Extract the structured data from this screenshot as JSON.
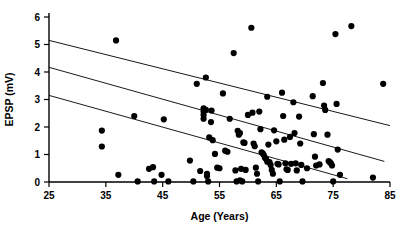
{
  "chart_data": {
    "type": "scatter",
    "title": "",
    "xlabel": "Age (Years)",
    "ylabel": "EPSP (mV)",
    "xlim": [
      25,
      85
    ],
    "ylim": [
      0,
      6
    ],
    "xticks": [
      25,
      35,
      45,
      55,
      65,
      75,
      85
    ],
    "yticks": [
      0,
      1,
      2,
      3,
      4,
      5,
      6
    ],
    "xtick_labels": [
      "25",
      "35",
      "45",
      "55",
      "65",
      "75",
      "85"
    ],
    "ytick_labels": [
      "0",
      "1",
      "2",
      "3",
      "4",
      "5",
      "6"
    ],
    "grid": false,
    "legend": null,
    "marker": "filled-circle",
    "marker_color": "#000000",
    "points": [
      [
        34.3,
        1.87
      ],
      [
        34.3,
        1.29
      ],
      [
        36.8,
        5.15
      ],
      [
        37.2,
        0.26
      ],
      [
        40.0,
        2.4
      ],
      [
        40.6,
        0.02
      ],
      [
        42.6,
        0.48
      ],
      [
        43.3,
        0.54
      ],
      [
        43.5,
        0.02
      ],
      [
        44.8,
        0.26
      ],
      [
        45.2,
        2.28
      ],
      [
        46.0,
        0.02
      ],
      [
        49.8,
        0.78
      ],
      [
        50.4,
        0.02
      ],
      [
        51.0,
        3.57
      ],
      [
        51.6,
        0.4
      ],
      [
        52.2,
        2.68
      ],
      [
        52.2,
        2.56
      ],
      [
        52.2,
        2.44
      ],
      [
        52.2,
        2.3
      ],
      [
        52.6,
        3.8
      ],
      [
        52.6,
        2.62
      ],
      [
        52.8,
        0.3
      ],
      [
        52.8,
        0.22
      ],
      [
        53.0,
        0.02
      ],
      [
        53.2,
        1.62
      ],
      [
        53.5,
        2.18
      ],
      [
        53.6,
        2.6
      ],
      [
        53.8,
        1.52
      ],
      [
        54.2,
        1.02
      ],
      [
        54.6,
        0.52
      ],
      [
        55.0,
        0.5
      ],
      [
        55.6,
        3.22
      ],
      [
        56.0,
        1.14
      ],
      [
        56.4,
        1.1
      ],
      [
        56.8,
        2.3
      ],
      [
        57.5,
        4.69
      ],
      [
        57.8,
        0.42
      ],
      [
        58.0,
        0.02
      ],
      [
        58.2,
        1.86
      ],
      [
        58.4,
        1.72
      ],
      [
        58.6,
        1.78
      ],
      [
        58.6,
        0.06
      ],
      [
        58.8,
        0.48
      ],
      [
        59.0,
        0.02
      ],
      [
        59.2,
        1.44
      ],
      [
        59.4,
        1.42
      ],
      [
        59.6,
        0.44
      ],
      [
        60.0,
        2.44
      ],
      [
        60.6,
        5.61
      ],
      [
        60.8,
        2.52
      ],
      [
        61.0,
        1.4
      ],
      [
        61.2,
        1.3
      ],
      [
        61.4,
        0.52
      ],
      [
        61.6,
        0.3
      ],
      [
        61.8,
        0.02
      ],
      [
        62.0,
        2.56
      ],
      [
        62.2,
        1.92
      ],
      [
        62.4,
        1.08
      ],
      [
        62.6,
        1.04
      ],
      [
        62.8,
        0.98
      ],
      [
        63.0,
        0.88
      ],
      [
        63.2,
        0.84
      ],
      [
        63.4,
        0.74
      ],
      [
        63.4,
        3.1
      ],
      [
        63.6,
        1.36
      ],
      [
        63.8,
        0.72
      ],
      [
        64.0,
        0.62
      ],
      [
        64.2,
        0.44
      ],
      [
        64.4,
        0.3
      ],
      [
        64.6,
        1.88
      ],
      [
        65.0,
        1.48
      ],
      [
        65.2,
        0.66
      ],
      [
        65.4,
        0.64
      ],
      [
        65.6,
        0.02
      ],
      [
        66.0,
        3.25
      ],
      [
        66.2,
        2.4
      ],
      [
        66.4,
        1.54
      ],
      [
        66.6,
        0.68
      ],
      [
        66.8,
        0.46
      ],
      [
        67.0,
        0.44
      ],
      [
        67.4,
        1.64
      ],
      [
        67.6,
        0.66
      ],
      [
        68.0,
        2.9
      ],
      [
        68.2,
        1.78
      ],
      [
        68.4,
        0.68
      ],
      [
        68.6,
        0.42
      ],
      [
        69.0,
        2.38
      ],
      [
        69.2,
        1.4
      ],
      [
        69.4,
        0.62
      ],
      [
        69.6,
        0.02
      ],
      [
        70.4,
        0.5
      ],
      [
        71.4,
        3.12
      ],
      [
        71.6,
        1.74
      ],
      [
        71.8,
        0.92
      ],
      [
        72.0,
        0.6
      ],
      [
        72.6,
        0.64
      ],
      [
        73.2,
        3.6
      ],
      [
        73.4,
        2.78
      ],
      [
        73.6,
        2.62
      ],
      [
        74.0,
        1.72
      ],
      [
        74.2,
        0.76
      ],
      [
        74.4,
        0.72
      ],
      [
        74.6,
        0.68
      ],
      [
        74.8,
        0.6
      ],
      [
        75.0,
        0.02
      ],
      [
        75.4,
        5.38
      ],
      [
        75.6,
        2.84
      ],
      [
        75.8,
        1.18
      ],
      [
        76.2,
        0.26
      ],
      [
        78.2,
        5.67
      ],
      [
        83.8,
        3.57
      ],
      [
        82.0,
        0.16
      ]
    ],
    "fit_lines": [
      {
        "name": "upper-confidence-line",
        "x": [
          25,
          85
        ],
        "y": [
          5.15,
          2.05
        ]
      },
      {
        "name": "regression-line",
        "x": [
          25,
          84
        ],
        "y": [
          4.17,
          0.75
        ]
      },
      {
        "name": "lower-confidence-line",
        "x": [
          25,
          77.5
        ],
        "y": [
          3.15,
          0.12
        ]
      }
    ]
  }
}
